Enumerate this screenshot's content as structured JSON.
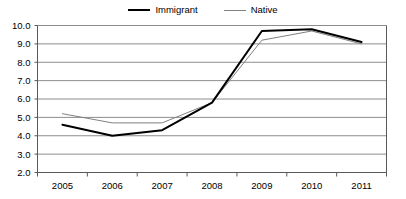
{
  "chart_data": {
    "type": "line",
    "title": "",
    "subtitle": "",
    "xlabel": "",
    "ylabel": "",
    "categories": [
      "2005",
      "2006",
      "2007",
      "2008",
      "2009",
      "2010",
      "2011"
    ],
    "x": [
      2005,
      2006,
      2007,
      2008,
      2009,
      2010,
      2011
    ],
    "series": [
      {
        "name": "Immigrant",
        "color": "#000000",
        "line_width": 2,
        "values": [
          4.6,
          4.0,
          4.3,
          5.8,
          9.7,
          9.8,
          9.1
        ]
      },
      {
        "name": "Native",
        "color": "#808080",
        "line_width": 1,
        "values": [
          5.2,
          4.7,
          4.7,
          5.8,
          9.2,
          9.7,
          9.0
        ]
      }
    ],
    "ylim": [
      2.0,
      10.0
    ],
    "ytick_labels": [
      "10.0",
      "9.0",
      "8.0",
      "7.0",
      "6.0",
      "5.0",
      "4.0",
      "3.0",
      "2.0"
    ],
    "ytick_values": [
      10.0,
      9.0,
      8.0,
      7.0,
      6.0,
      5.0,
      4.0,
      3.0,
      2.0
    ],
    "xtick_labels": [
      "2005",
      "2006",
      "2007",
      "2008",
      "2009",
      "2010",
      "2011"
    ],
    "grid": true,
    "grid_color": "#8c8c8c",
    "axis_color": "#595959",
    "plot_background": "#ffffff",
    "legend": {
      "position": "top-center",
      "entries": [
        "Immigrant",
        "Native"
      ]
    }
  },
  "legend": {
    "immigrant_label": "Immigrant",
    "native_label": "Native"
  }
}
